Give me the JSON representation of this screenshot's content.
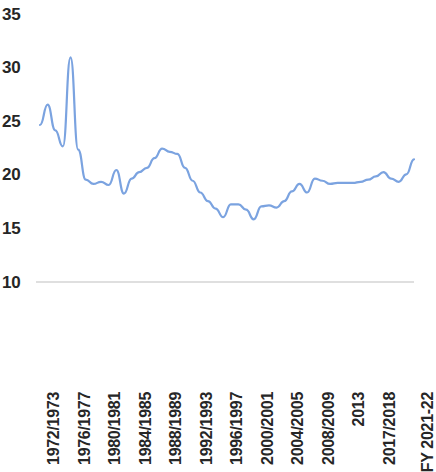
{
  "chart_data": {
    "type": "line",
    "title": "",
    "subtitle": "",
    "xlabel": "",
    "ylabel": "",
    "ylim": [
      10,
      35
    ],
    "xlim": [
      0,
      50
    ],
    "grid": false,
    "legend": "none",
    "axis_line": true,
    "line_color": "#7BA3E0",
    "line_width": 2.2,
    "y_ticks": [
      35,
      30,
      25,
      20,
      15,
      10
    ],
    "x_tick_labels": [
      "1972/1973",
      "1976/1977",
      "1980/1981",
      "1984/1985",
      "1988/1989",
      "1992/1993",
      "1996/1997",
      "2000/2001",
      "2004/2005",
      "2008/2009",
      "2013",
      "2017/2018",
      "FY 2021-22"
    ],
    "x_tick_indices": [
      0,
      4,
      8,
      12,
      16,
      20,
      24,
      28,
      32,
      36,
      40,
      44,
      49
    ],
    "categories": [
      "1972/1973",
      "1973/1974",
      "1974/1975",
      "1975/1976",
      "1976/1977",
      "1977/1978",
      "1978/1979",
      "1979/1980",
      "1980/1981",
      "1981/1982",
      "1982/1983",
      "1983/1984",
      "1984/1985",
      "1985/1986",
      "1986/1987",
      "1987/1988",
      "1988/1989",
      "1989/1990",
      "1990/1991",
      "1991/1992",
      "1992/1993",
      "1993/1994",
      "1994/1995",
      "1995/1996",
      "1996/1997",
      "1997/1998",
      "1998/1999",
      "1999/2000",
      "2000/2001",
      "2001/2002",
      "2002/2003",
      "2003/2004",
      "2004/2005",
      "2005/2006",
      "2006/2007",
      "2007/2008",
      "2008/2009",
      "2009/2010",
      "2010/2011",
      "2011/2012",
      "2013",
      "2014",
      "2015",
      "2016",
      "2017/2018",
      "2018/2019",
      "2019/2020",
      "2020/2021",
      "FY 2020-21",
      "FY 2021-22"
    ],
    "values": [
      24.6,
      26.5,
      24.1,
      22.6,
      30.9,
      22.3,
      19.5,
      19.1,
      19.3,
      19.0,
      20.4,
      18.2,
      19.6,
      20.2,
      20.6,
      21.5,
      22.4,
      22.1,
      21.9,
      20.6,
      19.4,
      18.3,
      17.5,
      16.8,
      16.0,
      17.2,
      17.2,
      16.7,
      15.8,
      17.0,
      17.1,
      16.9,
      17.5,
      18.4,
      19.1,
      18.3,
      19.6,
      19.4,
      19.1,
      19.2,
      19.2,
      19.2,
      19.3,
      19.5,
      19.8,
      20.2,
      19.6,
      19.3,
      20.0,
      21.4
    ],
    "series": [
      {
        "name": "value",
        "color": "#7BA3E0",
        "values": [
          24.6,
          26.5,
          24.1,
          22.6,
          30.9,
          22.3,
          19.5,
          19.1,
          19.3,
          19.0,
          20.4,
          18.2,
          19.6,
          20.2,
          20.6,
          21.5,
          22.4,
          22.1,
          21.9,
          20.6,
          19.4,
          18.3,
          17.5,
          16.8,
          16.0,
          17.2,
          17.2,
          16.7,
          15.8,
          17.0,
          17.1,
          16.9,
          17.5,
          18.4,
          19.1,
          18.3,
          19.6,
          19.4,
          19.1,
          19.2,
          19.2,
          19.2,
          19.3,
          19.5,
          19.8,
          20.2,
          19.6,
          19.3,
          20.0,
          21.4
        ]
      }
    ]
  }
}
